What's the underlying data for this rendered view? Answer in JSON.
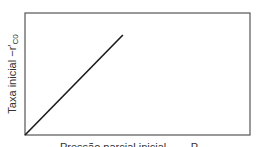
{
  "chart_data": {
    "type": "line",
    "title": "",
    "xlabel": "Pressão parcial inicial (clipped)",
    "ylabel": "Taxa inicial −r′C0",
    "ylabel_parts": {
      "main": "Taxa inicial −r′",
      "subscript": "C0"
    },
    "xlabel_visible": "Pressão parcial inicial,       P",
    "series": [
      {
        "name": "rate",
        "x": [
          0,
          0.435
        ],
        "y": [
          0,
          0.82
        ],
        "color": "#1a1a1a"
      }
    ],
    "xlim": [
      0,
      1
    ],
    "ylim": [
      0,
      1
    ],
    "grid": false,
    "ticks": false,
    "legend": null,
    "frame_color": "#555555"
  }
}
